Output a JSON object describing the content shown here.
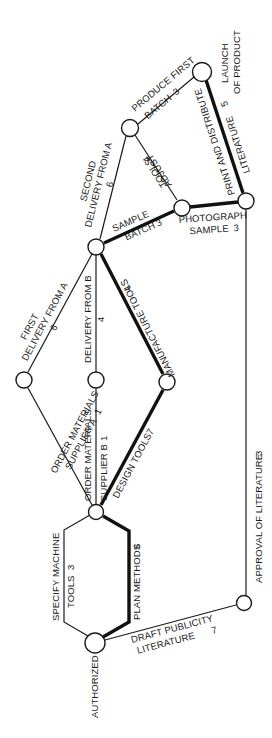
{
  "diagram": {
    "type": "critical-path network (activity-on-arrow), rotated 90°",
    "colors": {
      "line": "#1a1a1a",
      "critical_path": "#111111",
      "background": "#ffffff"
    },
    "nodes": [
      {
        "id": "authorized",
        "label": "AUTHORIZED"
      },
      {
        "id": "hub",
        "label": ""
      },
      {
        "id": "supplier_a",
        "label": ""
      },
      {
        "id": "supplier_b",
        "label": ""
      },
      {
        "id": "manufacture",
        "label": ""
      },
      {
        "id": "sample",
        "label": ""
      },
      {
        "id": "produce",
        "label": ""
      },
      {
        "id": "photograph",
        "label": ""
      },
      {
        "id": "print",
        "label": ""
      },
      {
        "id": "launch",
        "label": "LAUNCH",
        "label2": "OF PRODUCT"
      },
      {
        "id": "draft",
        "label": ""
      }
    ],
    "activities": {
      "specify_machine_tools": {
        "line1": "SPECIFY MACHINE",
        "line2": "TOOLS",
        "duration": "3",
        "critical": false
      },
      "plan_methods": {
        "line1": "PLAN METHODS",
        "duration": "6",
        "critical": true
      },
      "draft_publicity": {
        "line1": "DRAFT PUBLICITY",
        "line2": "LITERATURE",
        "duration": "7",
        "critical": false
      },
      "order_materials_a": {
        "line1": "ORDER MATERIALS",
        "line2": "SUPPLIER A",
        "duration": "1",
        "critical": false
      },
      "order_materials_b": {
        "line1": "ORDER MATERIALS",
        "line2": "SUPPLIER B",
        "duration": "1",
        "critical": false
      },
      "design_tools": {
        "line1": "DESIGN TOOLS",
        "duration": "7",
        "critical": true
      },
      "first_delivery_a": {
        "line1": "FIRST",
        "line2": "DELIVERY FROM A",
        "duration": "6",
        "critical": false
      },
      "delivery_b": {
        "line1": "DELIVERY FROM B",
        "duration": "4",
        "critical": false
      },
      "manufacture_tools": {
        "line1": "MANUFACTURE TOOLS",
        "duration": "4",
        "critical": true
      },
      "second_delivery_a": {
        "line1": "SECOND",
        "line2": "DELIVERY FROM A",
        "duration": "6",
        "critical": false
      },
      "sample_batch": {
        "line1": "SAMPLE",
        "line2": "BATCH",
        "duration": "3",
        "critical": true
      },
      "produce_first_batch": {
        "line1": "PRODUCE FIRST",
        "line2": "BATCH",
        "duration": "3",
        "critical": false
      },
      "adjust_tools": {
        "line1": "ADJUST",
        "line2": "TOOLS",
        "duration": "4",
        "critical": false
      },
      "photograph_sample": {
        "line1": "PHOTOGRAPH",
        "line2": "SAMPLE",
        "duration": "3",
        "critical": true
      },
      "print_distribute": {
        "line1": "PRINT AND DISTRIBUTE",
        "line2": "LITERATURE",
        "duration": "5",
        "critical": true
      },
      "approval_literature": {
        "line1": "APPROVAL OF LITERATURE",
        "duration": "3",
        "critical": false
      }
    }
  }
}
